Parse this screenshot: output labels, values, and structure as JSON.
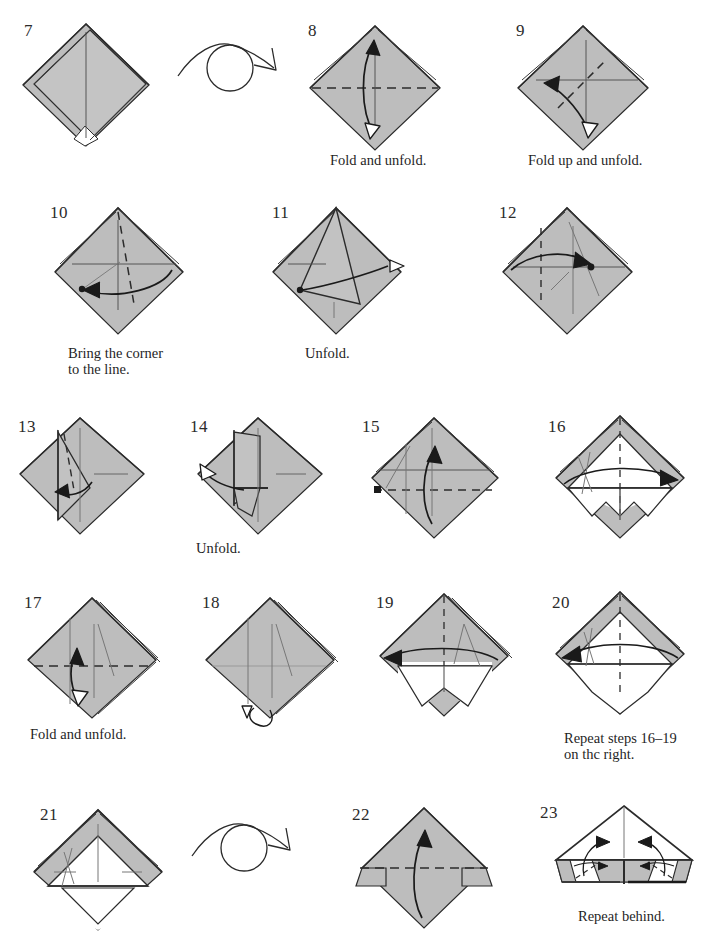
{
  "page": {
    "background_color": "#ffffff",
    "paper_front_color": "#bdbdbd",
    "paper_back_color": "#ffffff",
    "line_color": "#2b2b2b",
    "crease_color": "#6e6e6e"
  },
  "steps": [
    {
      "number": "7",
      "caption": "",
      "diagram": "diamond-layered-white-tip"
    },
    {
      "number": "8",
      "caption": "Fold and unfold.",
      "diagram": "diamond-horizontal-valley-updown-arrow"
    },
    {
      "number": "9",
      "caption": "Fold up and unfold.",
      "diagram": "diamond-diagonal-valley-left-arrow"
    },
    {
      "number": "10",
      "caption": "Bring the corner\nto the line.",
      "diagram": "diamond-diagonal-dashed-dot-left-arrow"
    },
    {
      "number": "11",
      "caption": "Unfold.",
      "diagram": "diamond-folded-flap-hollow-arrow"
    },
    {
      "number": "12",
      "caption": "",
      "diagram": "diamond-vertical-dashed-dot-right-arrow"
    },
    {
      "number": "13",
      "caption": "",
      "diagram": "diamond-narrow-flap-dashed-left-arrow"
    },
    {
      "number": "14",
      "caption": "Unfold.",
      "diagram": "diamond-narrow-flap-hollow-up-left-arrow"
    },
    {
      "number": "15",
      "caption": "",
      "diagram": "diamond-dot-horizontal-dashed-up-arrow"
    },
    {
      "number": "16",
      "caption": "",
      "diagram": "diamond-white-triangle-vertical-dashed-right-arrow"
    },
    {
      "number": "17",
      "caption": "Fold and unfold.",
      "diagram": "diamond-layered-horizontal-dashed-hollow-arrow"
    },
    {
      "number": "18",
      "caption": "",
      "diagram": "diamond-layered-pull-loop-arrow"
    },
    {
      "number": "19",
      "caption": "",
      "diagram": "diamond-white-bottom-left-arc-arrow"
    },
    {
      "number": "20",
      "caption": "Repeat steps 16–19\non thc right.",
      "diagram": "diamond-white-triangle-both-arcs"
    },
    {
      "number": "21",
      "caption": "",
      "diagram": "diamond-gray-wings-white-center"
    },
    {
      "number": "22",
      "caption": "",
      "diagram": "diamond-horizontal-dashed-up-arrow-corner-flaps"
    },
    {
      "number": "23",
      "caption": "Repeat behind.",
      "diagram": "wide-triangle-two-inward-arrows"
    }
  ],
  "symbols": [
    {
      "name": "turn-over-arrow",
      "row": "1",
      "description": "arc over circle with arrowhead"
    },
    {
      "name": "turn-over-arrow",
      "row": "5",
      "description": "arc over circle with arrowhead"
    }
  ]
}
